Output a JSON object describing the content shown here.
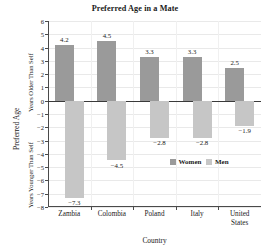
{
  "chart_data": {
    "type": "bar",
    "title": "Preferred Age in a Mate",
    "xlabel": "Country",
    "ylabel": "Preferred Age",
    "ylabel_upper": "Years Older Than Self",
    "ylabel_lower": "Years Younger Than Self",
    "categories": [
      "Zambia",
      "Colombia",
      "Poland",
      "Italy",
      "United States"
    ],
    "category_lines": [
      [
        "Zambia"
      ],
      [
        "Colombia"
      ],
      [
        "Poland"
      ],
      [
        "Italy"
      ],
      [
        "United",
        "States"
      ]
    ],
    "series": [
      {
        "name": "Women",
        "color": "#9a9a9a",
        "values": [
          4.2,
          4.5,
          3.3,
          3.3,
          2.5
        ],
        "labels": [
          "4.2",
          "4.5",
          "3.3",
          "3.3",
          "2.5"
        ]
      },
      {
        "name": "Men",
        "color": "#c6c6c6",
        "values": [
          -7.3,
          -4.5,
          -2.8,
          -2.8,
          -1.9
        ],
        "labels": [
          "−7.3",
          "−4.5",
          "−2.8",
          "−2.8",
          "−1.9"
        ]
      }
    ],
    "ylim": [
      -8,
      6
    ],
    "yticks": [
      6,
      5,
      4,
      3,
      2,
      1,
      0,
      -1,
      -2,
      -3,
      -4,
      -5,
      -6,
      -7,
      -8
    ],
    "ytick_labels": [
      "6",
      "5",
      "4",
      "3",
      "2",
      "1",
      "0",
      "−1",
      "−2",
      "−3",
      "−4",
      "−5",
      "−6",
      "−7",
      "−8"
    ],
    "grid": "horizontal",
    "legend_position": "inside-lower-right",
    "legend_entries": [
      "Women",
      "Men"
    ]
  }
}
